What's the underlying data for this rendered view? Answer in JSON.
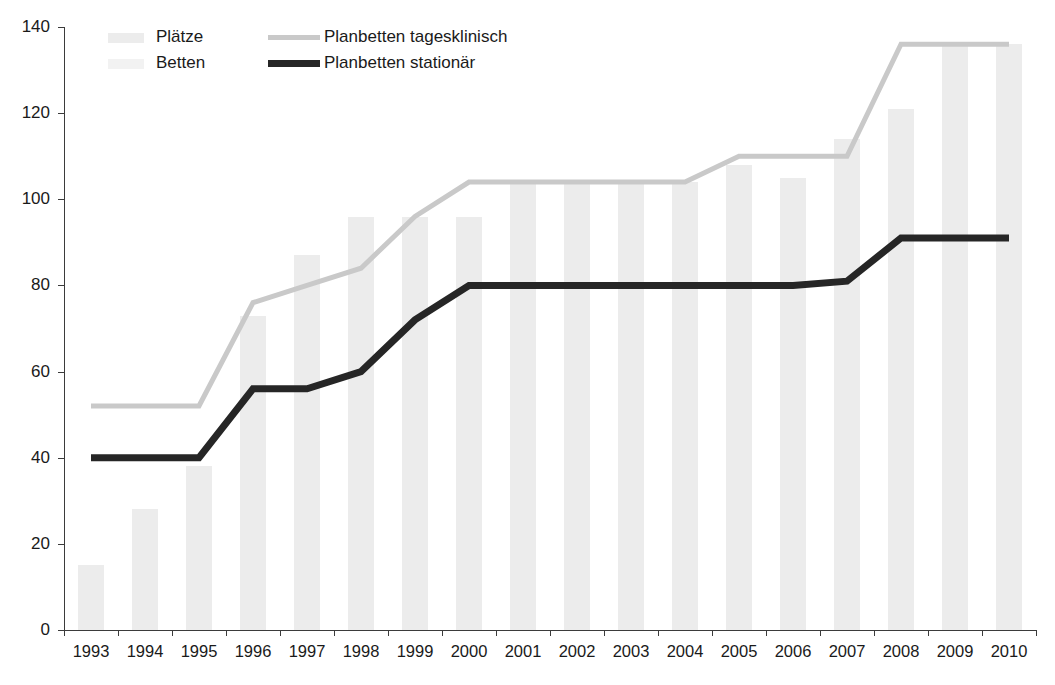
{
  "chart_data": {
    "type": "bar",
    "title": "",
    "subtitle": "",
    "xlabel": "",
    "ylabel": "",
    "xlim_categories": [
      "1993",
      "1994",
      "1995",
      "1996",
      "1997",
      "1998",
      "1999",
      "2000",
      "2001",
      "2002",
      "2003",
      "2004",
      "2005",
      "2006",
      "2007",
      "2008",
      "2009",
      "2010"
    ],
    "ylim": [
      0,
      140
    ],
    "ytick_step": 20,
    "yticks": [
      0,
      20,
      40,
      60,
      80,
      100,
      120,
      140
    ],
    "grid": false,
    "legend_position": "top-left-inside",
    "categories": [
      "1993",
      "1994",
      "1995",
      "1996",
      "1997",
      "1998",
      "1999",
      "2000",
      "2001",
      "2002",
      "2003",
      "2004",
      "2005",
      "2006",
      "2007",
      "2008",
      "2009",
      "2010"
    ],
    "series": [
      {
        "name": "Plätze",
        "kind": "bar",
        "color": "#ececec",
        "values": [
          15,
          28,
          38,
          73,
          87,
          96,
          96,
          96,
          104,
          104,
          104,
          104,
          108,
          105,
          114,
          121,
          136,
          136
        ]
      },
      {
        "name": "Betten",
        "kind": "bar",
        "color": "#f2f2f2",
        "values": [
          15,
          28,
          38,
          73,
          87,
          96,
          96,
          96,
          104,
          104,
          104,
          104,
          108,
          105,
          114,
          121,
          136,
          136
        ]
      },
      {
        "name": "Planbetten tagesklinisch",
        "kind": "line",
        "color": "#c9c9c9",
        "values": [
          52,
          52,
          52,
          76,
          80,
          84,
          96,
          104,
          104,
          104,
          104,
          104,
          110,
          110,
          110,
          136,
          136,
          136
        ]
      },
      {
        "name": "Planbetten stationär",
        "kind": "line",
        "color": "#262626",
        "values": [
          40,
          40,
          40,
          56,
          56,
          60,
          72,
          80,
          80,
          80,
          80,
          80,
          80,
          80,
          81,
          91,
          91,
          91
        ]
      }
    ]
  },
  "legend": {
    "entries": [
      {
        "label": "Plätze",
        "swatch": "bar",
        "color": "#ececec"
      },
      {
        "label": "Betten",
        "swatch": "bar",
        "color": "#f2f2f2"
      },
      {
        "label": "Planbetten tagesklinisch",
        "swatch": "line-light",
        "color": "#c9c9c9"
      },
      {
        "label": "Planbetten stationär",
        "swatch": "line-dark",
        "color": "#262626"
      }
    ]
  },
  "axes": {
    "y_labels": [
      "140",
      "120",
      "100",
      "80",
      "60",
      "40",
      "20",
      "0"
    ],
    "x_labels": [
      "1993",
      "1994",
      "1995",
      "1996",
      "1997",
      "1998",
      "1999",
      "2000",
      "2001",
      "2002",
      "2003",
      "2004",
      "2005",
      "2006",
      "2007",
      "2008",
      "2009",
      "2010"
    ]
  }
}
